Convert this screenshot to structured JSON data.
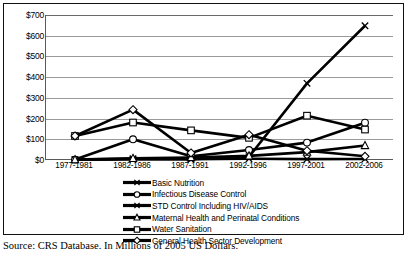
{
  "chart_data": {
    "type": "line",
    "title": "",
    "xlabel": "",
    "ylabel": "",
    "ylim": [
      0,
      700
    ],
    "ytick_step": 100,
    "ytick_prefix": "$",
    "grid": true,
    "legend_position": "bottom",
    "categories": [
      "1977-1981",
      "1982-1986",
      "1987-1991",
      "1992-1996",
      "1997-2001",
      "2002-2006"
    ],
    "ytick_labels": [
      "$700",
      "$600",
      "$500",
      "$400",
      "$300",
      "$200",
      "$100",
      "$0"
    ],
    "series": [
      {
        "name": "Basic Nutrition",
        "marker": "x-marker",
        "values": [
          2,
          6,
          4,
          6,
          4,
          5
        ]
      },
      {
        "name": "Infectious Disease Control",
        "marker": "circle-marker",
        "values": [
          2,
          100,
          18,
          48,
          84,
          180
        ]
      },
      {
        "name": "STD Control Including HIV/AIDS",
        "marker": "x-marker",
        "values": [
          1,
          3,
          4,
          16,
          370,
          648
        ]
      },
      {
        "name": "Maternal Health and Perinatal Conditions",
        "marker": "triangle-marker",
        "values": [
          2,
          8,
          12,
          20,
          38,
          70
        ]
      },
      {
        "name": "Water Sanitation",
        "marker": "square-marker",
        "values": [
          116,
          181,
          143,
          107,
          214,
          147
        ]
      },
      {
        "name": "General Health Sector Development",
        "marker": "diamond-marker",
        "values": [
          116,
          243,
          34,
          122,
          45,
          18
        ]
      }
    ]
  },
  "caption": {
    "text": "Source: CRS Database. In Millions of 2005 US Dollars."
  }
}
